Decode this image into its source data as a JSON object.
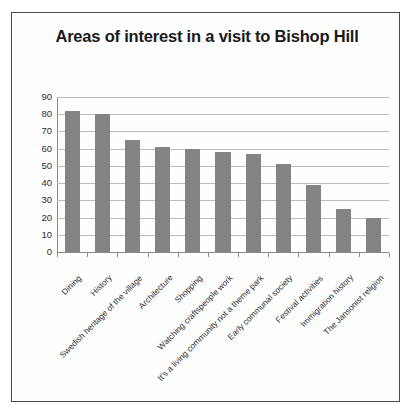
{
  "chart_data": {
    "type": "bar",
    "title": "Areas of interest in a visit to Bishop Hill",
    "xlabel": "",
    "ylabel": "",
    "ylim": [
      0,
      90
    ],
    "ytick_step": 10,
    "grid": true,
    "legend": false,
    "bar_color": "#848484",
    "categories": [
      "Dining",
      "History",
      "Swedish heritage of the village",
      "Architecture",
      "Shopping",
      "Watching craftspeople work",
      "It's a living community not a theme park",
      "Early communal society",
      "Festival activities",
      "Immigration history",
      "The Jansonist religion"
    ],
    "values": [
      82,
      80,
      65,
      61,
      60,
      58,
      57,
      51,
      39,
      25,
      20
    ],
    "yticks": [
      "0",
      "10",
      "20",
      "30",
      "40",
      "50",
      "60",
      "70",
      "80",
      "90"
    ]
  },
  "frame": {
    "border_color": "#4a4a4a",
    "background": "#fefefe"
  }
}
